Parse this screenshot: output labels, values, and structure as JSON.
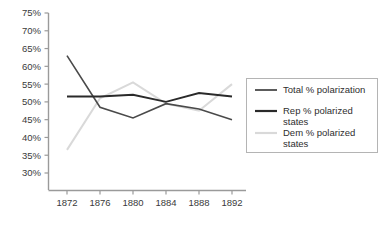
{
  "chart_data": {
    "type": "line",
    "title": "",
    "subtitle": "",
    "xlabel": "",
    "ylabel": "",
    "x": [
      1872,
      1876,
      1880,
      1884,
      1888,
      1892
    ],
    "categories": [
      "1872",
      "1876",
      "1880",
      "1884",
      "1888",
      "1892"
    ],
    "xtick_labels": [
      "1872",
      "1876",
      "1880",
      "1884",
      "1888",
      "1892"
    ],
    "ytick_labels": [
      "75%",
      "70%",
      "65%",
      "60%",
      "55%",
      "50%",
      "45%",
      "40%",
      "35%",
      "30%"
    ],
    "ytick_values": [
      75,
      70,
      65,
      60,
      55,
      50,
      45,
      40,
      35,
      30
    ],
    "ylim": [
      30,
      75
    ],
    "xlim": [
      1870,
      1894
    ],
    "grid": false,
    "legend_position": "right",
    "series": [
      {
        "name": "Total % polarization",
        "label": "Total % polarization",
        "color": "#4a4a4a",
        "width": 1.6,
        "values": [
          63.0,
          48.5,
          45.5,
          49.5,
          48.0,
          45.0
        ]
      },
      {
        "name": "Rep % polarized states",
        "label": "Rep % polarized states",
        "label_line1": "Rep % polarized",
        "label_line2": "states",
        "color": "#2a2a2a",
        "width": 1.9,
        "values": [
          51.5,
          51.5,
          52.0,
          50.0,
          52.5,
          51.5
        ]
      },
      {
        "name": "Dem % polarized states",
        "label": "Dem % polarized states",
        "label_line1": "Dem % polarized",
        "label_line2": "states",
        "color": "#d9d9d9",
        "width": 2.0,
        "values": [
          36.5,
          51.0,
          55.5,
          49.5,
          47.5,
          55.0
        ]
      }
    ]
  },
  "legend": {
    "entries": [
      {
        "label": "Total % polarization",
        "line1": "Total % polarization",
        "line2": "",
        "color": "#4a4a4a"
      },
      {
        "label": "Rep % polarized states",
        "line1": "Rep % polarized",
        "line2": "states",
        "color": "#2a2a2a"
      },
      {
        "label": "Dem % polarized states",
        "line1": "Dem % polarized",
        "line2": "states",
        "color": "#d9d9d9"
      }
    ]
  },
  "colors": {
    "background": "#ffffff",
    "axis": "#9a9a9a",
    "text": "#3a3a3a",
    "legend_border": "#b4b4b4",
    "total": "#4a4a4a",
    "rep": "#2a2a2a",
    "dem": "#d9d9d9"
  }
}
